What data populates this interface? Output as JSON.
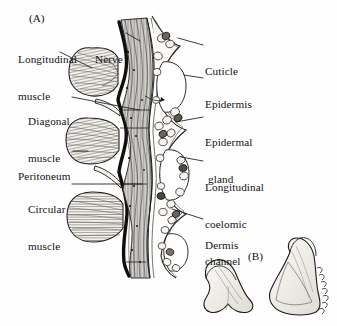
{
  "figure": {
    "kind": "anatomical-line-drawing",
    "background_color": "#fefefe",
    "ink_color": "#111111",
    "fill_tint": "#f2f0ec"
  },
  "panels": [
    {
      "id": "A",
      "tag": "(A)",
      "tag_x": 29,
      "tag_y": 12
    },
    {
      "id": "B",
      "tag": "(B)",
      "tag_x": 248,
      "tag_y": 250
    }
  ],
  "labels_left": [
    {
      "name": "longitudinal-muscle",
      "line1": "Longitudinal",
      "line2": "muscle",
      "x": 18,
      "y": 28,
      "leader": {
        "x1": 60,
        "y1": 52,
        "x2": 92,
        "y2": 68
      }
    },
    {
      "name": "nerve",
      "line1": "Nerve",
      "line2": "",
      "x": 95,
      "y": 28,
      "leader": {
        "x1": 126,
        "y1": 33,
        "x2": 140,
        "y2": 40
      }
    },
    {
      "name": "diagonal-muscle",
      "line1": "Diagonal",
      "line2": "muscle",
      "x": 28,
      "y": 90,
      "leader": {
        "x1": 70,
        "y1": 97,
        "x2": 139,
        "y2": 110
      }
    },
    {
      "name": "peritoneum",
      "line1": "Peritoneum",
      "line2": "",
      "x": 18,
      "y": 145,
      "leader": {
        "x1": 73,
        "y1": 151,
        "x2": 88,
        "y2": 151
      }
    },
    {
      "name": "circular-muscle",
      "line1": "Circular",
      "line2": "muscle",
      "x": 28,
      "y": 178,
      "leader": {
        "x1": 72,
        "y1": 184,
        "x2": 142,
        "y2": 184
      }
    }
  ],
  "labels_right": [
    {
      "name": "cuticle",
      "line1": "Cuticle",
      "line2": "",
      "x": 205,
      "y": 40,
      "leader": {
        "x1": 202,
        "y1": 45,
        "x2": 178,
        "y2": 40
      }
    },
    {
      "name": "epidermis",
      "line1": "Epidermis",
      "line2": "",
      "x": 205,
      "y": 73,
      "leader": {
        "x1": 202,
        "y1": 78,
        "x2": 184,
        "y2": 75
      }
    },
    {
      "name": "epidermal-gland",
      "line1": "Epidermal",
      "line2": "gland",
      "x": 205,
      "y": 111,
      "leader": {
        "x1": 202,
        "y1": 117,
        "x2": 176,
        "y2": 122
      }
    },
    {
      "name": "longitudinal-coelomic-channel",
      "line1": "Longitudinal",
      "line2": "coelomic",
      "line3": "channel",
      "x": 205,
      "y": 156,
      "leader": {
        "x1": 202,
        "y1": 161,
        "x2": 180,
        "y2": 158
      }
    },
    {
      "name": "dermis",
      "line1": "Dermis",
      "line2": "",
      "x": 205,
      "y": 214,
      "leader": {
        "x1": 202,
        "y1": 219,
        "x2": 172,
        "y2": 210
      }
    }
  ],
  "chaetae": [
    {
      "name": "chaeta-small",
      "serrated": false,
      "cx": 232,
      "cy": 285
    },
    {
      "name": "chaeta-large",
      "serrated": true,
      "cx": 292,
      "cy": 280
    }
  ]
}
